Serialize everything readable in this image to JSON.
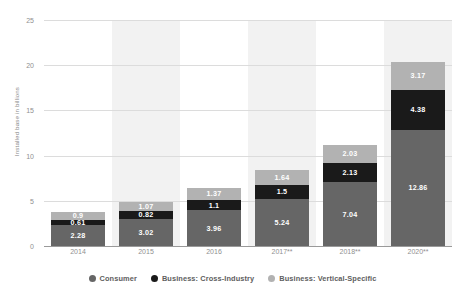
{
  "chart_data": {
    "type": "bar",
    "stacked": true,
    "title": "",
    "xlabel": "",
    "ylabel": "Installed base in billions",
    "ylim": [
      0,
      25
    ],
    "yticks": [
      0,
      5,
      10,
      15,
      20,
      25
    ],
    "grid": true,
    "legend_position": "bottom",
    "categories": [
      "2014",
      "2015",
      "2016",
      "2017**",
      "2018**",
      "2020**"
    ],
    "series": [
      {
        "name": "Consumer",
        "color": "#666666",
        "values": [
          2.28,
          3.02,
          3.96,
          5.24,
          7.04,
          12.86
        ],
        "labels": [
          "2.28",
          "3.02",
          "3.96",
          "5.24",
          "7.04",
          "12.86"
        ]
      },
      {
        "name": "Business: Cross-Industry",
        "color": "#1a1a1a",
        "values": [
          0.61,
          0.82,
          1.1,
          1.5,
          2.13,
          4.38
        ],
        "labels": [
          "0.61",
          "0.82",
          "1.1",
          "1.5",
          "2.13",
          "4.38"
        ]
      },
      {
        "name": "Business: Vertical-Specific",
        "color": "#b2b2b2",
        "values": [
          0.9,
          1.07,
          1.37,
          1.64,
          2.03,
          3.17
        ],
        "labels": [
          "0.9",
          "1.07",
          "1.37",
          "1.64",
          "2.03",
          "3.17"
        ]
      }
    ],
    "totals": [
      3.79,
      4.91,
      6.43,
      8.38,
      11.2,
      20.41
    ],
    "band_categories": [
      "2015",
      "2017**",
      "2020**"
    ],
    "colors": {
      "consumer": "#666666",
      "cross_industry": "#1a1a1a",
      "vertical_specific": "#b2b2b2",
      "band": "#ededed",
      "gridline": "#dcdcdc",
      "axis": "#9a9a9a",
      "tick_text": "#8f8f8f",
      "legend_text": "#5e5e5e"
    }
  }
}
